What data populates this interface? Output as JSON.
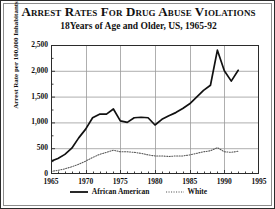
{
  "chart_data": {
    "type": "line",
    "title": "Arrest Rates for Drug Abuse Violations",
    "subtitle": "18Years of Age and Older, US, 1965-92",
    "xlabel": "",
    "ylabel": "Arrest Rate per 100,000 Inhabitants",
    "xlim": [
      1965,
      1995
    ],
    "ylim": [
      0,
      2500
    ],
    "grid": true,
    "legend_position": "bottom",
    "x_ticks": [
      1965,
      1970,
      1975,
      1980,
      1985,
      1990,
      1995
    ],
    "x_tick_labels": [
      "1965",
      "1970",
      "1975",
      "1980",
      "1985",
      "1990",
      "1995"
    ],
    "x_minor_tick_step": 1,
    "y_ticks": [
      0,
      500,
      1000,
      1500,
      2000,
      2500
    ],
    "y_tick_labels": [
      "0",
      "500",
      "1,000",
      "1,500",
      "2,000",
      "2,500"
    ],
    "x": [
      1965,
      1966,
      1967,
      1968,
      1969,
      1970,
      1971,
      1972,
      1973,
      1974,
      1975,
      1976,
      1977,
      1978,
      1979,
      1980,
      1981,
      1982,
      1983,
      1984,
      1985,
      1986,
      1987,
      1988,
      1989,
      1990,
      1991,
      1992
    ],
    "series": [
      {
        "name": "African American",
        "style": "solid",
        "color": "#111111",
        "values": [
          250,
          300,
          380,
          500,
          700,
          870,
          1090,
          1160,
          1160,
          1260,
          1030,
          1000,
          1090,
          1100,
          1090,
          950,
          1060,
          1130,
          1190,
          1270,
          1360,
          1490,
          1620,
          1720,
          2400,
          2000,
          1800,
          2010
        ]
      },
      {
        "name": "White",
        "style": "dotted",
        "color": "#555555",
        "values": [
          50,
          70,
          100,
          140,
          190,
          250,
          320,
          380,
          420,
          460,
          430,
          430,
          420,
          400,
          370,
          350,
          350,
          340,
          350,
          350,
          370,
          400,
          430,
          450,
          510,
          430,
          420,
          440
        ]
      }
    ]
  },
  "legend": {
    "items": [
      {
        "label": "African American",
        "style": "solid"
      },
      {
        "label": "White",
        "style": "dotted"
      }
    ]
  }
}
